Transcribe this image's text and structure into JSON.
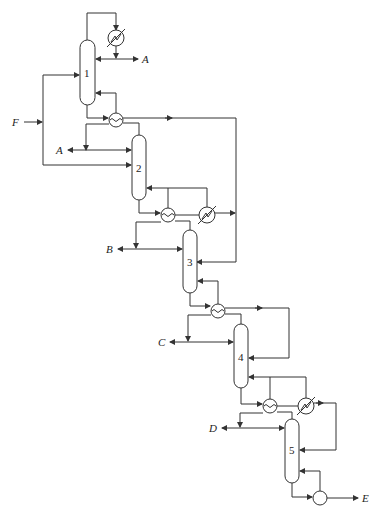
{
  "diagram": {
    "type": "distillation-column-sequence",
    "feed_label": "F",
    "columns": [
      {
        "id": "1",
        "label": "1"
      },
      {
        "id": "2",
        "label": "2"
      },
      {
        "id": "3",
        "label": "3"
      },
      {
        "id": "4",
        "label": "4"
      },
      {
        "id": "5",
        "label": "5"
      }
    ],
    "products": [
      {
        "id": "A1",
        "label": "A"
      },
      {
        "id": "A2",
        "label": "A"
      },
      {
        "id": "B",
        "label": "B"
      },
      {
        "id": "C",
        "label": "C"
      },
      {
        "id": "D",
        "label": "D"
      },
      {
        "id": "E",
        "label": "E"
      }
    ],
    "equipment": {
      "condenser": "condenser-icon",
      "heat_exchanger": "heat-exchanger-icon",
      "heater": "heater-icon",
      "reboiler": "reboiler-icon"
    }
  }
}
